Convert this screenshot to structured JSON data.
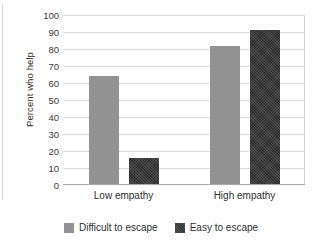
{
  "chart_data": {
    "type": "bar",
    "title": "",
    "xlabel": "",
    "ylabel": "Percent who help",
    "categories": [
      "Low empathy",
      "High empathy"
    ],
    "series": [
      {
        "name": "Difficult to escape",
        "color": "#929292",
        "values": [
          64,
          82
        ]
      },
      {
        "name": "Easy to escape",
        "color": "#3a3a3a",
        "values": [
          16,
          91
        ]
      }
    ],
    "ylim": [
      0,
      100
    ],
    "ytick_step": 10,
    "yticks": [
      0,
      10,
      20,
      30,
      40,
      50,
      60,
      70,
      80,
      90,
      100
    ],
    "grid": "horizontal",
    "legend_position": "bottom-center"
  },
  "colors": {
    "gray_series": "#929292",
    "dark_series": "#3a3a3a",
    "gridline": "#dedede",
    "axis": "#a8a8a8",
    "text": "#2f2f2f",
    "background": "#ffffff"
  }
}
